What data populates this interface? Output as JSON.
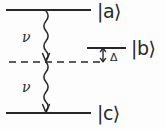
{
  "figure": {
    "type": "energy-level-diagram",
    "background_color": "#fdfdfd",
    "ink_color": "#26282b"
  },
  "levels": [
    {
      "id": "a",
      "label": "|a⟩",
      "style": "solid",
      "x1": 6,
      "x2": 91,
      "y": 10
    },
    {
      "id": "b",
      "label": "|b⟩",
      "style": "solid",
      "x1": 87,
      "x2": 126,
      "y": 48
    },
    {
      "id": "virtual",
      "label": "",
      "style": "dashed",
      "x1": 9,
      "x2": 101,
      "y": 62
    },
    {
      "id": "c",
      "label": "|c⟩",
      "style": "solid",
      "x1": 6,
      "x2": 91,
      "y": 113
    }
  ],
  "transitions": [
    {
      "id": "photon-upper",
      "label": "ν",
      "style": "wavy-arrow",
      "direction": "down",
      "from_level": "a",
      "to_level": "virtual",
      "x": 46,
      "y_start": 11,
      "y_end": 62
    },
    {
      "id": "photon-lower",
      "label": "ν",
      "style": "wavy-arrow",
      "direction": "down",
      "from_level": "virtual",
      "to_level": "c",
      "x": 46,
      "y_start": 62,
      "y_end": 113
    }
  ],
  "detuning": {
    "symbol": "Δ",
    "style": "double-headed-arrow",
    "x": 103,
    "y_top": 48,
    "y_bottom": 62
  },
  "labels": {
    "ket_a": "|a⟩",
    "ket_b": "|b⟩",
    "ket_c": "|c⟩",
    "nu_upper": "ν",
    "nu_lower": "ν",
    "delta": "Δ"
  }
}
